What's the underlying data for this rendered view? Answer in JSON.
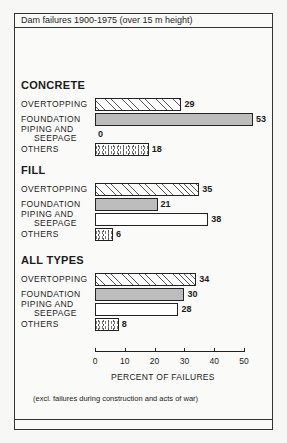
{
  "title": "Dam failures 1900-1975 (over 15 m height)",
  "footnote": "(excl. failures during construction and acts of war)",
  "chart_data": {
    "type": "bar",
    "orientation": "horizontal",
    "title": "Dam failures 1900-1975 (over 15 m height)",
    "xlabel": "PERCENT OF FAILURES",
    "ylabel": "",
    "xlim": [
      0,
      50
    ],
    "xticks": [
      0,
      10,
      20,
      30,
      40,
      50
    ],
    "grid": false,
    "legend": "none (patterns encode category)",
    "categories": [
      "OVERTOPPING",
      "FOUNDATION",
      "PIPING AND SEEPAGE",
      "OTHERS"
    ],
    "series": [
      {
        "name": "CONCRETE",
        "values": [
          29,
          53,
          0,
          18
        ]
      },
      {
        "name": "FILL",
        "values": [
          35,
          21,
          38,
          6
        ]
      },
      {
        "name": "ALL TYPES",
        "values": [
          34,
          30,
          28,
          8
        ]
      }
    ],
    "annotation": "(excl. failures during construction and acts of war)"
  },
  "groups": [
    {
      "name": "CONCRETE",
      "bars": [
        {
          "label1": "OVERTOPPING",
          "label2": "",
          "value": "29"
        },
        {
          "label1": "FOUNDATION",
          "label2": "",
          "value": "53"
        },
        {
          "label1": "PIPING AND",
          "label2": "SEEPAGE",
          "value": "0"
        },
        {
          "label1": "OTHERS",
          "label2": "",
          "value": "18"
        }
      ]
    },
    {
      "name": "FILL",
      "bars": [
        {
          "label1": "OVERTOPPING",
          "label2": "",
          "value": "35"
        },
        {
          "label1": "FOUNDATION",
          "label2": "",
          "value": "21"
        },
        {
          "label1": "PIPING AND",
          "label2": "SEEPAGE",
          "value": "38"
        },
        {
          "label1": "OTHERS",
          "label2": "",
          "value": "6"
        }
      ]
    },
    {
      "name": "ALL TYPES",
      "bars": [
        {
          "label1": "OVERTOPPING",
          "label2": "",
          "value": "34"
        },
        {
          "label1": "FOUNDATION",
          "label2": "",
          "value": "30"
        },
        {
          "label1": "PIPING AND",
          "label2": "SEEPAGE",
          "value": "28"
        },
        {
          "label1": "OTHERS",
          "label2": "",
          "value": "8"
        }
      ]
    }
  ],
  "axis": {
    "ticks": [
      "0",
      "10",
      "20",
      "30",
      "40",
      "50"
    ],
    "label": "PERCENT OF FAILURES"
  }
}
